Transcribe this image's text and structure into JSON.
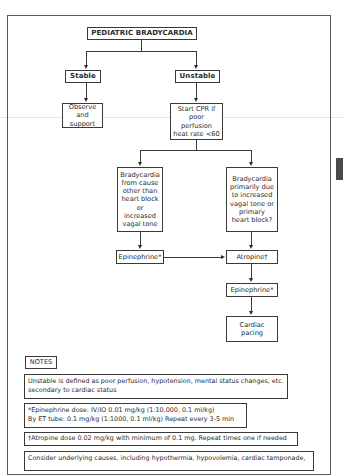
{
  "flowchart": {
    "title": "PEDIATRIC BRADYCARDIA",
    "stable": "Stable",
    "unstable": "Unstable",
    "observe": "Observe and\nsupport",
    "cpr": "Start CPR if\npoor perfusion\nheat rate <60",
    "branch_other": "Bradycardia\nfrom cause\nother than\nheart block\nor increased\nvagal tone",
    "branch_vagal": "Bradycardia\nprimarily due\nto increased\nvagal tone or\nprimary\nheart block?",
    "epinephrine_left": "Epinephrine*",
    "atropine": "Atropine†",
    "epinephrine_right": "Epinephrine*",
    "cardiac_pacing": "Cardiac\npacing"
  },
  "notes": {
    "header": "NOTES",
    "items": [
      "Unstable is defined as poor perfusion, hypotension, mental status changes, etc.\nsecondary to cardiac status",
      "*Epinephrine dose: IV/IO 0.01 mg/kg (1:10,000, 0.1 ml/kg)\nBy ET tube: 0.1 mg/kg (1:1000, 0.1 ml/kg) Repeat every 3-5 min",
      "†Atropine dose 0.02 mg/kg with minimum of 0.1 mg. Repeat times one if needed",
      "Consider underlying causes, including hypothermia, hypovolemia, cardiac tamponade,"
    ]
  },
  "colors": {
    "line": "#3a3a3a",
    "side_tab": "#4a4a4a"
  }
}
